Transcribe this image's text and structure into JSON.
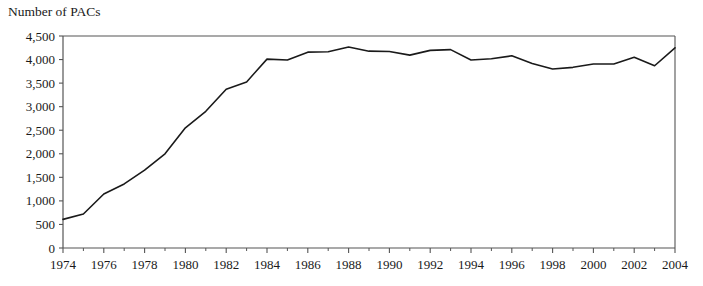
{
  "chart_data": {
    "type": "line",
    "title": "Number of PACs",
    "xlabel": "",
    "ylabel": "",
    "grid": false,
    "legend": false,
    "legend_position": "none",
    "line_color": "#1a1a1a",
    "background_color": "#ffffff",
    "axis_color": "#555555",
    "xlim": [
      1974,
      2004
    ],
    "ylim": [
      0,
      4500
    ],
    "ytick_values": [
      0,
      500,
      1000,
      1500,
      2000,
      2500,
      3000,
      3500,
      4000,
      4500
    ],
    "ytick_labels": [
      "0",
      "500",
      "1,000",
      "1,500",
      "2,000",
      "2,500",
      "3,000",
      "3,500",
      "4,000",
      "4,500"
    ],
    "xtick_values": [
      1974,
      1976,
      1978,
      1980,
      1982,
      1984,
      1986,
      1988,
      1990,
      1992,
      1994,
      1996,
      1998,
      2000,
      2002,
      2004
    ],
    "xtick_labels": [
      "1974",
      "1976",
      "1978",
      "1980",
      "1982",
      "1984",
      "1986",
      "1988",
      "1990",
      "1992",
      "1994",
      "1996",
      "1998",
      "2000",
      "2002",
      "2004"
    ],
    "xminor_values": [
      1975,
      1977,
      1979,
      1981,
      1983,
      1985,
      1987,
      1989,
      1991,
      1993,
      1995,
      1997,
      1999,
      2001,
      2003
    ],
    "x": [
      1974,
      1975,
      1976,
      1977,
      1978,
      1979,
      1980,
      1981,
      1982,
      1983,
      1984,
      1985,
      1986,
      1987,
      1988,
      1989,
      1990,
      1991,
      1992,
      1993,
      1994,
      1995,
      1996,
      1997,
      1998,
      1999,
      2000,
      2001,
      2002,
      2003,
      2004
    ],
    "values": [
      608,
      722,
      1146,
      1360,
      1653,
      2000,
      2551,
      2901,
      3371,
      3525,
      4009,
      3992,
      4157,
      4165,
      4268,
      4178,
      4172,
      4094,
      4195,
      4210,
      3992,
      4016,
      4079,
      3917,
      3798,
      3835,
      3907,
      3907,
      4048,
      3868,
      4250
    ],
    "annotations": []
  }
}
